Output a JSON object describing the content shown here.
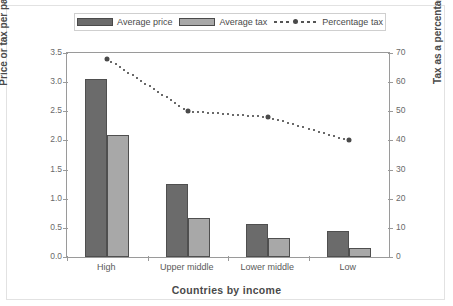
{
  "chart_data": {
    "type": "bar",
    "title": "",
    "xlabel": "Countries by income",
    "ylabel": "Price or tax per pack ($US)",
    "ylabel_secondary": "Tax as a percentage of price",
    "categories": [
      "High",
      "Upper middle",
      "Lower middle",
      "Low"
    ],
    "ylim": [
      0,
      3.5
    ],
    "yticks": [
      "0.0",
      "0.5",
      "1.0",
      "1.5",
      "2.0",
      "2.5",
      "3.0",
      "3.5"
    ],
    "ylim_secondary": [
      0,
      70
    ],
    "yticks_secondary": [
      "0",
      "10",
      "20",
      "30",
      "40",
      "50",
      "60",
      "70"
    ],
    "grid": false,
    "legend_position": "top",
    "series": [
      {
        "name": "Average price",
        "type": "bar",
        "axis": "left",
        "color": "#6b6b6b",
        "values": [
          3.05,
          1.25,
          0.57,
          0.45
        ]
      },
      {
        "name": "Average tax",
        "type": "bar",
        "axis": "left",
        "color": "#a8a8a8",
        "values": [
          2.1,
          0.67,
          0.33,
          0.15
        ]
      },
      {
        "name": "Percentage tax",
        "type": "line",
        "axis": "right",
        "color": "#4a4a4a",
        "style": "dotted",
        "values": [
          68,
          50,
          48,
          40
        ]
      }
    ]
  },
  "legend": {
    "items": [
      {
        "label": "Average price",
        "marker": "dark-swatch"
      },
      {
        "label": "Average tax",
        "marker": "light-swatch"
      },
      {
        "label": "Percentage tax",
        "marker": "dotted-line-with-point"
      }
    ]
  },
  "axes": {
    "left_title": "Price or tax per pack ($US)",
    "right_title": "Tax as a percentage of price",
    "bottom_title": "Countries by income"
  }
}
